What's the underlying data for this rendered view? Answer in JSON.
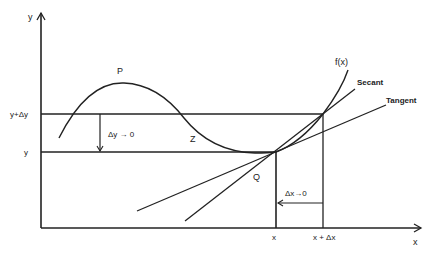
{
  "diagram": {
    "axes": {
      "x_label": "x",
      "y_label": "y"
    },
    "tick_labels": {
      "y_top": "y+Δy",
      "y_bottom": "y",
      "x_left": "x",
      "x_right": "x + Δx"
    },
    "points": {
      "p": "P",
      "z": "Z",
      "q": "Q"
    },
    "curve_label": "f(x)",
    "line_labels": {
      "secant": "Secant",
      "tangent": "Tangent"
    },
    "annotations": {
      "dy": "Δy → 0",
      "dx": "Δx→0"
    },
    "colors": {
      "stroke": "#222222",
      "background": "#ffffff"
    }
  }
}
